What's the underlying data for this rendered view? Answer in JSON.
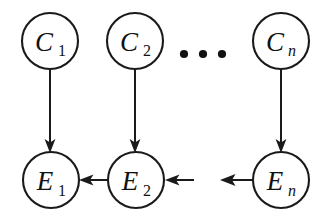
{
  "figure": {
    "type": "causal-graph",
    "title": "",
    "background_color": "#ffffff",
    "stroke_color": "#1a1a1a",
    "canvas": {
      "width": 334,
      "height": 221
    }
  },
  "nodes": [
    {
      "id": "C1",
      "label_main": "C",
      "label_sub": "1",
      "sub_italic": false,
      "row": "cause",
      "cx": 50,
      "cy": 41,
      "r": 28
    },
    {
      "id": "C2",
      "label_main": "C",
      "label_sub": "2",
      "sub_italic": false,
      "row": "cause",
      "cx": 135,
      "cy": 41,
      "r": 28
    },
    {
      "id": "Cn",
      "label_main": "C",
      "label_sub": "n",
      "sub_italic": true,
      "row": "cause",
      "cx": 281,
      "cy": 41,
      "r": 28
    },
    {
      "id": "E1",
      "label_main": "E",
      "label_sub": "1",
      "sub_italic": false,
      "row": "effect",
      "cx": 51,
      "cy": 180,
      "r": 28
    },
    {
      "id": "E2",
      "label_main": "E",
      "label_sub": "2",
      "sub_italic": false,
      "row": "effect",
      "cx": 136,
      "cy": 180,
      "r": 28
    },
    {
      "id": "En",
      "label_main": "E",
      "label_sub": "n",
      "sub_italic": true,
      "row": "effect",
      "cx": 281,
      "cy": 180,
      "r": 28
    }
  ],
  "edges": [
    {
      "id": "C1-E1",
      "from": "C1",
      "to": "E1",
      "direction": "down",
      "label": ""
    },
    {
      "id": "C2-E2",
      "from": "C2",
      "to": "E2",
      "direction": "down",
      "label": ""
    },
    {
      "id": "Cn-En",
      "from": "Cn",
      "to": "En",
      "direction": "down",
      "label": ""
    },
    {
      "id": "E2-E1",
      "from": "E2",
      "to": "E1",
      "direction": "left",
      "label": ""
    },
    {
      "id": "gap-E2",
      "from": "",
      "to": "E2",
      "direction": "left",
      "label": ""
    },
    {
      "id": "En-gap",
      "from": "En",
      "to": "",
      "direction": "left",
      "label": ""
    }
  ],
  "ellipsis": {
    "symbol": "...",
    "dot_count": 3,
    "cx": 203,
    "cy": 54,
    "spacing": 19,
    "radius": 4
  }
}
